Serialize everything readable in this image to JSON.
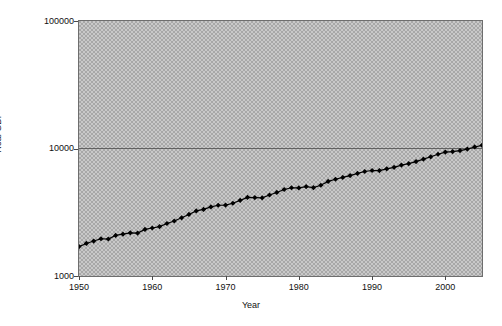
{
  "chart_data": {
    "type": "line",
    "title": "",
    "xlabel": "Year",
    "ylabel": "Real GDP",
    "yscale": "log",
    "ylim": [
      1000,
      100000
    ],
    "xlim": [
      1950,
      2005
    ],
    "ytick_labels": [
      "1000",
      "10000",
      "100000"
    ],
    "ytick_values": [
      1000,
      10000,
      100000
    ],
    "xtick_labels": [
      "1950",
      "1960",
      "1970",
      "1980",
      "1990",
      "2000"
    ],
    "xtick_values": [
      1950,
      1960,
      1970,
      1980,
      1990,
      2000
    ],
    "grid": "horizontal-major-only",
    "legend": "none",
    "marker": "filled-diamond",
    "line_color": "#000000",
    "plot_background": "#a8a8a8",
    "series": [
      {
        "name": "Real GDP",
        "x": [
          1950,
          1951,
          1952,
          1953,
          1954,
          1955,
          1956,
          1957,
          1958,
          1959,
          1960,
          1961,
          1962,
          1963,
          1964,
          1965,
          1966,
          1967,
          1968,
          1969,
          1970,
          1971,
          1972,
          1973,
          1974,
          1975,
          1976,
          1977,
          1978,
          1979,
          1980,
          1981,
          1982,
          1983,
          1984,
          1985,
          1986,
          1987,
          1988,
          1989,
          1990,
          1991,
          1992,
          1993,
          1994,
          1995,
          1996,
          1997,
          1998,
          1999,
          2000,
          2001,
          2002,
          2003,
          2004,
          2005
        ],
        "values": [
          1700,
          1800,
          1880,
          1960,
          1950,
          2080,
          2130,
          2180,
          2170,
          2320,
          2380,
          2440,
          2580,
          2700,
          2860,
          3040,
          3240,
          3330,
          3480,
          3590,
          3600,
          3720,
          3920,
          4140,
          4120,
          4100,
          4320,
          4520,
          4770,
          4920,
          4910,
          5030,
          4930,
          5150,
          5520,
          5740,
          5930,
          6130,
          6380,
          6600,
          6720,
          6710,
          6930,
          7120,
          7410,
          7600,
          7890,
          8250,
          8610,
          9010,
          9370,
          9460,
          9630,
          9900,
          10280,
          10600
        ]
      }
    ]
  },
  "axes": {
    "ylabel": "Real GDP",
    "xlabel": "Year",
    "yticks": [
      {
        "label": "100000",
        "value": 100000
      },
      {
        "label": "10000",
        "value": 10000
      },
      {
        "label": "1000",
        "value": 1000
      }
    ],
    "xticks": [
      {
        "label": "1950",
        "value": 1950
      },
      {
        "label": "1960",
        "value": 1960
      },
      {
        "label": "1970",
        "value": 1970
      },
      {
        "label": "1980",
        "value": 1980
      },
      {
        "label": "1990",
        "value": 1990
      },
      {
        "label": "2000",
        "value": 2000
      }
    ]
  }
}
